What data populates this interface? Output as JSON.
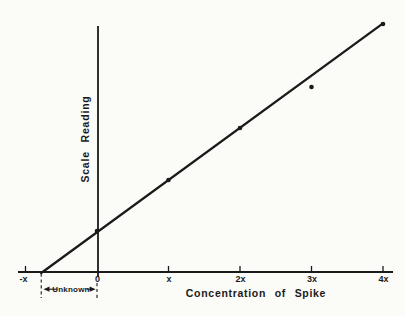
{
  "figure": {
    "background": "#fbfbf8",
    "ink": "#1a1a1a"
  },
  "chart_data": {
    "type": "scatter",
    "title": "",
    "xlabel": "Concentration of Spike",
    "ylabel": "Scale Reading",
    "grid": false,
    "legend": null,
    "x_ticks": [
      {
        "label": "-x",
        "value": -1
      },
      {
        "label": "0",
        "value": 0
      },
      {
        "label": "x",
        "value": 1
      },
      {
        "label": "2x",
        "value": 2
      },
      {
        "label": "3x",
        "value": 3
      },
      {
        "label": "4x",
        "value": 4
      }
    ],
    "y_axis": "unlabeled, no ticks (arbitrary scale-reading units)",
    "points": [
      {
        "x": 0,
        "y": 41
      },
      {
        "x": 1,
        "y": 92
      },
      {
        "x": 2,
        "y": 144
      },
      {
        "x": 3,
        "y": 185
      },
      {
        "x": 4,
        "y": 248
      }
    ],
    "fit_line": {
      "x_start": -0.78,
      "x_end": 4.0,
      "x_intercept": -0.78,
      "slope_units_per_x": 52
    },
    "annotation": {
      "label": "Unknown",
      "from_x": -0.78,
      "to_x": 0
    }
  }
}
